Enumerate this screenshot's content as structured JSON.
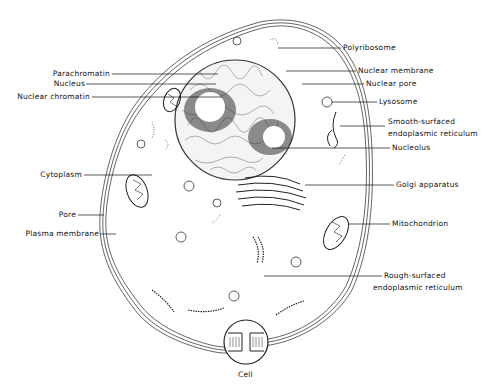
{
  "diagram": {
    "title": "Cell",
    "labels_left": [
      {
        "id": "parachromatin",
        "text": "Parachromatin"
      },
      {
        "id": "nucleus",
        "text": "Nucleus"
      },
      {
        "id": "nuclear-chromatin",
        "text": "Nuclear chromatin"
      },
      {
        "id": "cytoplasm",
        "text": "Cytoplasm"
      },
      {
        "id": "pore",
        "text": "Pore"
      },
      {
        "id": "plasma-membrane",
        "text": "Plasma membrane"
      }
    ],
    "labels_right": [
      {
        "id": "polyribosome",
        "text": "Polyribosome"
      },
      {
        "id": "nuclear-membrane",
        "text": "Nuclear membrane"
      },
      {
        "id": "nuclear-pore",
        "text": "Nuclear pore"
      },
      {
        "id": "lysosome",
        "text": "Lysosome"
      },
      {
        "id": "smooth-er-1",
        "text": "Smooth-surfaced"
      },
      {
        "id": "smooth-er-2",
        "text": "endoplasmic reticulum"
      },
      {
        "id": "nucleolus",
        "text": "Nucleolus"
      },
      {
        "id": "golgi",
        "text": "Golgi apparatus"
      },
      {
        "id": "mitochondrion",
        "text": "Mitochondrion"
      },
      {
        "id": "rough-er-1",
        "text": "Rough-surfaced"
      },
      {
        "id": "rough-er-2",
        "text": "endoplasmic reticulum"
      }
    ],
    "caption": "Cell"
  }
}
